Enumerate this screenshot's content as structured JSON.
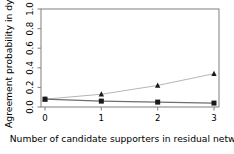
{
  "chart_data": {
    "type": "line",
    "title": "",
    "subtitle": "",
    "xlabel": "Number of candidate supporters in residual network",
    "ylabel": "Agreement probability in dyad",
    "x": [
      0,
      1,
      2,
      3
    ],
    "categories": [
      "0",
      "1",
      "2",
      "3"
    ],
    "xticklabels": [
      "0",
      "1",
      "2",
      "3"
    ],
    "yticklabels": [
      "0.0",
      "0.2",
      "0.4",
      "0.6",
      "0.8",
      "1.0"
    ],
    "yticks": [
      0.0,
      0.2,
      0.4,
      0.6,
      0.8,
      1.0
    ],
    "xlim": [
      -0.12,
      3.12
    ],
    "ylim": [
      0.0,
      1.0
    ],
    "grid": false,
    "legend": "none",
    "series": [
      {
        "name": "increasing-series",
        "marker": "triangle",
        "line_color": "#b6b6b6",
        "marker_color": "#1a1a1a",
        "values": [
          0.08,
          0.13,
          0.22,
          0.34
        ]
      },
      {
        "name": "flat-series",
        "marker": "square",
        "line_color": "#6e6e6e",
        "marker_color": "#1a1a1a",
        "values": [
          0.08,
          0.06,
          0.05,
          0.04
        ]
      }
    ]
  },
  "figure": {
    "background_color": "#ffffff",
    "frame_color": "#8a8a8a",
    "text_color": "#000000"
  }
}
